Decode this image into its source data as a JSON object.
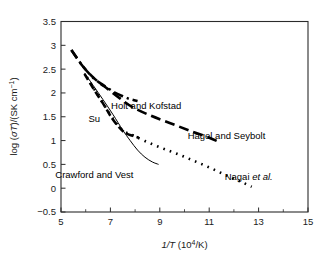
{
  "chart_data": {
    "type": "line",
    "title": "",
    "xlabel": "1/T (10⁴/K)",
    "ylabel": "log (σT)/(SK cm⁻¹)",
    "xlim": [
      5,
      15
    ],
    "ylim": [
      -0.5,
      3.5
    ],
    "xticks": [
      5,
      7,
      9,
      11,
      13,
      15
    ],
    "xtick_labels": [
      "5",
      "7",
      "9",
      "11",
      "13",
      "15"
    ],
    "xminor_ticks": [
      6,
      8,
      10,
      12,
      14
    ],
    "yticks": [
      -0.5,
      0,
      0.5,
      1,
      1.5,
      2,
      2.5,
      3,
      3.5
    ],
    "ytick_labels": [
      "−0.5",
      "0",
      "0.5",
      "1",
      "1.5",
      "2",
      "2.5",
      "3",
      "3.5"
    ],
    "grid": false,
    "legend_position": "inline-annotations",
    "series": [
      {
        "name": "Holt and Kofstad",
        "linestyle": "dashdot",
        "label_text": "Holt and Kofstad",
        "points": [
          [
            5.42,
            2.9
          ],
          [
            5.9,
            2.55
          ],
          [
            6.3,
            2.32
          ],
          [
            6.6,
            2.2
          ],
          [
            6.9,
            2.1
          ],
          [
            7.2,
            2.0
          ],
          [
            7.5,
            1.93
          ],
          [
            7.8,
            1.87
          ],
          [
            8.1,
            1.83
          ]
        ]
      },
      {
        "name": "Hagel and Seybolt",
        "linestyle": "longdash",
        "label_text": "Hagel and Seybolt",
        "points": [
          [
            5.42,
            2.9
          ],
          [
            5.9,
            2.55
          ],
          [
            6.4,
            2.28
          ],
          [
            6.9,
            2.08
          ],
          [
            7.4,
            1.88
          ],
          [
            7.9,
            1.7
          ],
          [
            8.6,
            1.53
          ],
          [
            9.4,
            1.37
          ],
          [
            10.2,
            1.21
          ],
          [
            11.0,
            1.06
          ],
          [
            11.45,
            0.96
          ]
        ]
      },
      {
        "name": "Nagai et al.",
        "linestyle": "dotted",
        "label_text": "Nagai et al.",
        "points": [
          [
            6.05,
            2.33
          ],
          [
            6.5,
            1.95
          ],
          [
            6.95,
            1.58
          ],
          [
            7.3,
            1.32
          ],
          [
            7.6,
            1.18
          ],
          [
            7.95,
            1.1
          ],
          [
            8.4,
            0.99
          ],
          [
            8.9,
            0.88
          ],
          [
            9.4,
            0.78
          ],
          [
            9.9,
            0.68
          ],
          [
            10.4,
            0.57
          ],
          [
            10.9,
            0.46
          ],
          [
            11.4,
            0.34
          ],
          [
            11.9,
            0.22
          ],
          [
            12.35,
            0.12
          ],
          [
            12.72,
            0.03
          ]
        ]
      },
      {
        "name": "Su",
        "linestyle": "dashed",
        "label_text": "Su",
        "points": [
          [
            5.95,
            2.4
          ],
          [
            6.3,
            2.1
          ],
          [
            6.7,
            1.78
          ],
          [
            7.05,
            1.48
          ],
          [
            7.35,
            1.28
          ],
          [
            7.6,
            1.16
          ],
          [
            7.9,
            1.1
          ],
          [
            8.15,
            1.06
          ]
        ]
      },
      {
        "name": "Crawford and Vest",
        "linestyle": "solid",
        "label_text": "Crawford and Vest",
        "points": [
          [
            5.95,
            2.42
          ],
          [
            6.3,
            2.16
          ],
          [
            6.7,
            1.86
          ],
          [
            7.1,
            1.55
          ],
          [
            7.5,
            1.22
          ],
          [
            7.8,
            1.0
          ],
          [
            8.1,
            0.8
          ],
          [
            8.4,
            0.65
          ],
          [
            8.7,
            0.55
          ],
          [
            8.95,
            0.5
          ]
        ]
      }
    ],
    "annotations": [
      {
        "text": "Holt and Kofstad",
        "x": 8.45,
        "y": 1.73
      },
      {
        "text": "Hagel and Seybolt",
        "x": 11.7,
        "y": 1.1
      },
      {
        "text": "Nagai et al.",
        "x": 12.6,
        "y": 0.25,
        "italic_part": "et al."
      },
      {
        "text": "Crawford and Vest",
        "x": 6.35,
        "y": 0.28
      },
      {
        "text": "Su",
        "x": 6.35,
        "y": 1.47
      }
    ]
  }
}
